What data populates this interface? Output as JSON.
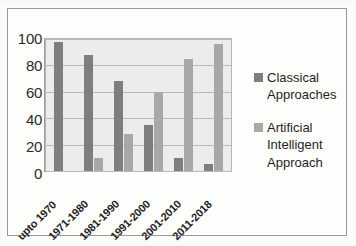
{
  "chart_data": {
    "type": "bar",
    "title": "",
    "subtitle": "",
    "xlabel": "",
    "ylabel": "",
    "ylim": [
      0,
      100
    ],
    "yticks": [
      100,
      80,
      60,
      40,
      20,
      0
    ],
    "grid": true,
    "legend_position": "right",
    "categories": [
      "upto 1970",
      "1971-1980",
      "1981-1990",
      "1991-2000",
      "2001-2010",
      "2011-2018"
    ],
    "series": [
      {
        "name": "Classical Approaches",
        "color": "#7e7e7e",
        "values": [
          98,
          88,
          68,
          35,
          10,
          5
        ]
      },
      {
        "name": "Artificial Intelligent Approach",
        "color": "#a8a8a6",
        "values": [
          0,
          10,
          28,
          60,
          85,
          96
        ]
      }
    ]
  },
  "legend": {
    "entries": [
      {
        "label_line1": "Classical",
        "label_line2": "Approaches",
        "label_line3": ""
      },
      {
        "label_line1": "Artificial",
        "label_line2": "Intelligent",
        "label_line3": "Approach"
      }
    ]
  },
  "colors": {
    "classical": "#7e7e7e",
    "artificial_intelligent": "#a8a8a6",
    "plot_background": "#ececea",
    "gridline": "#b9b9b7",
    "frame_border": "#9a9a9a"
  }
}
